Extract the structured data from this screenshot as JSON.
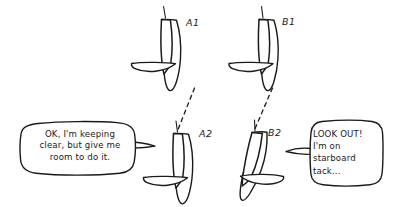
{
  "figure": {
    "style": "hand-drawn-sketch",
    "background_color": "#ffffff",
    "ink_color": "#1a1a1a"
  },
  "boats": [
    {
      "id": "A1",
      "label": "A1",
      "position": "upper-left-pair",
      "description": "sailboat seen from above, sail upright, boom to port"
    },
    {
      "id": "B1",
      "label": "B1",
      "position": "upper-right-pair",
      "description": "sailboat seen from above, sail upright, boom to port"
    },
    {
      "id": "A2",
      "label": "A2",
      "position": "lower-left-pair",
      "description": "sailboat seen from above, sail upright, boom to port"
    },
    {
      "id": "B2",
      "label": "B2",
      "position": "lower-right-pair",
      "description": "sailboat seen from above, heeled, boom to starboard"
    }
  ],
  "tracks": [
    {
      "name": "track-a",
      "from": "A2",
      "to": "A1",
      "style": "dashed"
    },
    {
      "name": "track-b",
      "from": "B2",
      "to": "B1",
      "style": "dashed"
    }
  ],
  "speech_bubbles": [
    {
      "id": "bubble-a",
      "speaker": "A2",
      "lines": [
        "OK, I'm keeping",
        "clear, but give me",
        "room to do it."
      ],
      "text": "OK, I'm keeping\nclear, but give me\nroom to do it.",
      "tail_direction": "right"
    },
    {
      "id": "bubble-b",
      "speaker": "B2",
      "lines": [
        "LOOK OUT!",
        "I'm on",
        "starboard",
        "tack..."
      ],
      "text": "LOOK OUT!\nI'm on\nstarboard\ntack...",
      "tail_direction": "left"
    }
  ]
}
